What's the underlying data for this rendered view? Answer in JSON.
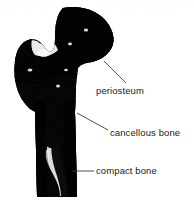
{
  "figure": {
    "subject": "bone",
    "background_color": "#ffffff",
    "ink_color": "#000000",
    "text_color": "#1a1a1a",
    "leader_color": "#3c3c3c"
  },
  "labels": [
    {
      "id": "periosteum",
      "text": "periosteum",
      "leader": {
        "x1": 126,
        "y1": 83,
        "x2": 104,
        "y2": 61
      }
    },
    {
      "id": "cancellous",
      "text": "cancellous bone",
      "leader": {
        "x1": 108,
        "y1": 130,
        "x2": 77,
        "y2": 113
      }
    },
    {
      "id": "compact",
      "text": "compact bone",
      "leader": {
        "x1": 94,
        "y1": 171,
        "x2": 72,
        "y2": 171
      }
    }
  ]
}
